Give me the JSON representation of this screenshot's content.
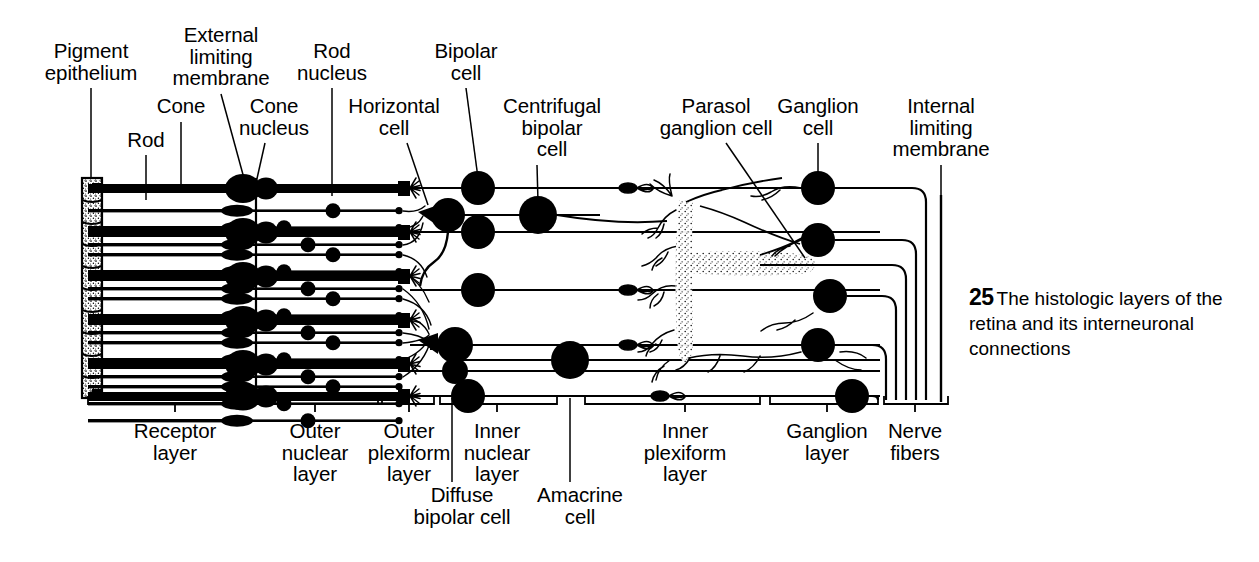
{
  "figure": {
    "number": "25",
    "caption_text": "The histologic layers of the retina and its interneuronal connections"
  },
  "colors": {
    "ink": "#000000",
    "background": "#ffffff",
    "stipple": "#000000"
  },
  "top_labels": [
    {
      "id": "pigment-epithelium",
      "text": "Pigment\nepithelium",
      "x": 91,
      "y": 40,
      "leader": {
        "x1": 91,
        "y1": 88,
        "x2": 91,
        "y2": 178
      }
    },
    {
      "id": "rod",
      "text": "Rod",
      "x": 146,
      "y": 129,
      "leader": {
        "x1": 146,
        "y1": 155,
        "x2": 146,
        "y2": 200
      }
    },
    {
      "id": "cone",
      "text": "Cone",
      "x": 181,
      "y": 95,
      "leader": {
        "x1": 181,
        "y1": 122,
        "x2": 181,
        "y2": 192
      }
    },
    {
      "id": "external-limiting-membrane",
      "text": "External\nlimiting\nmembrane",
      "x": 221,
      "y": 24,
      "leader": {
        "x1": 221,
        "y1": 94,
        "x2": 245,
        "y2": 182
      }
    },
    {
      "id": "cone-nucleus",
      "text": "Cone\nnucleus",
      "x": 274,
      "y": 95,
      "leader": {
        "x1": 265,
        "y1": 143,
        "x2": 256,
        "y2": 183
      }
    },
    {
      "id": "rod-nucleus",
      "text": "Rod\nnucleus",
      "x": 332,
      "y": 40,
      "leader": {
        "x1": 332,
        "y1": 88,
        "x2": 332,
        "y2": 196
      }
    },
    {
      "id": "horizontal-cell",
      "text": "Horizontal\ncell",
      "x": 394,
      "y": 95,
      "leader": {
        "x1": 407,
        "y1": 143,
        "x2": 428,
        "y2": 205
      }
    },
    {
      "id": "bipolar-cell",
      "text": "Bipolar\ncell",
      "x": 466,
      "y": 40,
      "leader": {
        "x1": 466,
        "y1": 88,
        "x2": 478,
        "y2": 178
      }
    },
    {
      "id": "centrifugal-bipolar-cell",
      "text": "Centrifugal\nbipolar\ncell",
      "x": 552,
      "y": 95,
      "leader": {
        "x1": 537,
        "y1": 165,
        "x2": 538,
        "y2": 202
      }
    },
    {
      "id": "parasol-ganglion-cell",
      "text": "Parasol\nganglion cell",
      "x": 716,
      "y": 95,
      "leader": {
        "x1": 726,
        "y1": 143,
        "x2": 805,
        "y2": 258
      }
    },
    {
      "id": "ganglion-cell",
      "text": "Ganglion\ncell",
      "x": 818,
      "y": 95,
      "leader": {
        "x1": 818,
        "y1": 143,
        "x2": 818,
        "y2": 178
      }
    },
    {
      "id": "internal-limiting-membrane",
      "text": "Internal\nlimiting\nmembrane",
      "x": 941,
      "y": 95,
      "leader": {
        "x1": 941,
        "y1": 165,
        "x2": 941,
        "y2": 195
      }
    }
  ],
  "bottom_labels": [
    {
      "id": "receptor-layer",
      "text": "Receptor\nlayer",
      "x": 175,
      "y": 420,
      "bracket": {
        "x1": 88,
        "x2": 243,
        "y": 404,
        "tick": 175
      }
    },
    {
      "id": "outer-nuclear-layer",
      "text": "Outer\nnuclear\nlayer",
      "x": 315,
      "y": 420,
      "bracket": {
        "x1": 248,
        "x2": 378,
        "y": 404,
        "tick": 315
      }
    },
    {
      "id": "outer-plexiform-layer",
      "text": "Outer\nplexiform\nlayer",
      "x": 409,
      "y": 420,
      "bracket": {
        "x1": 382,
        "x2": 434,
        "y": 404,
        "tick": 409
      }
    },
    {
      "id": "inner-nuclear-layer",
      "text": "Inner\nnuclear\nlayer",
      "x": 497,
      "y": 420,
      "bracket": {
        "x1": 440,
        "x2": 557,
        "y": 404,
        "tick": 497
      }
    },
    {
      "id": "inner-plexiform-layer",
      "text": "Inner\nplexiform\nlayer",
      "x": 685,
      "y": 420,
      "bracket": {
        "x1": 585,
        "x2": 760,
        "y": 404,
        "tick": 685
      }
    },
    {
      "id": "ganglion-layer",
      "text": "Ganglion\nlayer",
      "x": 827,
      "y": 420,
      "bracket": {
        "x1": 770,
        "x2": 878,
        "y": 404,
        "tick": 827
      }
    },
    {
      "id": "nerve-fibers",
      "text": "Nerve\nfibers",
      "x": 915,
      "y": 420,
      "bracket": {
        "x1": 884,
        "x2": 948,
        "y": 404,
        "tick": 915
      }
    }
  ],
  "callout_labels": [
    {
      "id": "diffuse-bipolar-cell",
      "text": "Diffuse\nbipolar cell",
      "x": 462,
      "y": 484,
      "leader": {
        "x1": 452,
        "y1": 482,
        "x2": 452,
        "y2": 398
      }
    },
    {
      "id": "amacrine-cell",
      "text": "Amacrine\ncell",
      "x": 580,
      "y": 484,
      "leader": {
        "x1": 570,
        "y1": 482,
        "x2": 570,
        "y2": 398
      }
    }
  ],
  "diagram": {
    "type": "anatomical-cross-section",
    "subject": "retina",
    "receptor_units": 5,
    "structures": [
      "pigment-epithelium-column",
      "rod-outer-segments",
      "cone-outer-segments",
      "external-limiting-membrane",
      "cone-nuclei",
      "rod-nuclei",
      "horizontal-cells",
      "bipolar-cells",
      "centrifugal-bipolar-cells",
      "diffuse-bipolar-cells",
      "amacrine-cells",
      "parasol-ganglion-cell",
      "ganglion-cells",
      "nerve-fiber-layer",
      "internal-limiting-membrane"
    ]
  }
}
